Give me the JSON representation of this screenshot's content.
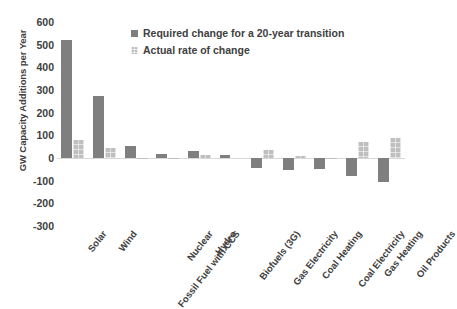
{
  "chart_data": {
    "type": "bar",
    "title": "",
    "xlabel": "",
    "ylabel": "GW Capacity Additions per Year",
    "ylim": [
      -300,
      600
    ],
    "ytick_step": 100,
    "yticks": [
      600,
      500,
      400,
      300,
      200,
      100,
      0,
      -100,
      -200,
      -300
    ],
    "ytick_labels": [
      "600",
      "500",
      "400",
      "300",
      "200",
      "100",
      "0",
      "-100",
      "-200",
      "-300"
    ],
    "grid": false,
    "legend_position": "top-center",
    "categories": [
      "Solar",
      "Wind",
      "Fossil Fuel with CCS",
      "Nuclear",
      "Hydro",
      "Biofuels (3G)",
      "Gas Electricity",
      "Coal Heating",
      "Coal Electricity",
      "Gas Heating",
      "Oil Products"
    ],
    "series": [
      {
        "name": "Required change for a 20-year transition",
        "color": "#7f7f7f",
        "values": [
          520,
          275,
          55,
          18,
          30,
          12,
          -45,
          -55,
          -48,
          -80,
          -105
        ]
      },
      {
        "name": "Actual rate of change",
        "color": "#bfbfbf",
        "values": [
          80,
          45,
          2,
          1,
          12,
          0,
          35,
          8,
          2,
          72,
          88
        ]
      }
    ]
  },
  "legend": {
    "items": [
      {
        "label": "Required change for a 20-year transition",
        "swatch": "dark"
      },
      {
        "label": "Actual rate of change",
        "swatch": "light"
      }
    ]
  },
  "axis": {
    "y_title": "GW Capacity Additions per Year"
  }
}
